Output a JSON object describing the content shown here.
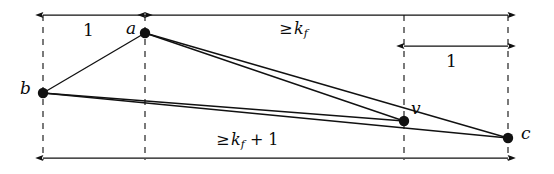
{
  "figure": {
    "type": "geometric-diagram",
    "background_color": "#ffffff",
    "ink_color": "#111111",
    "width": 554,
    "height": 174
  },
  "nodes": [
    {
      "id": "a",
      "label": "a",
      "x": 145,
      "y": 33,
      "label_x": 126,
      "label_y": 20,
      "dot_radius": 5.2
    },
    {
      "id": "b",
      "label": "b",
      "x": 43,
      "y": 93,
      "label_x": 20,
      "label_y": 80,
      "dot_radius": 5.2
    },
    {
      "id": "v",
      "label": "v",
      "x": 404,
      "y": 121,
      "label_x": 411,
      "label_y": 100,
      "dot_radius": 5.2
    },
    {
      "id": "c",
      "label": "c",
      "x": 508,
      "y": 138,
      "label_x": 521,
      "label_y": 125,
      "dot_radius": 5.2
    }
  ],
  "edges": [
    {
      "id": "b-a",
      "from": "b",
      "to": "a"
    },
    {
      "id": "a-v",
      "from": "a",
      "to": "v"
    },
    {
      "id": "a-c",
      "from": "a",
      "to": "c"
    },
    {
      "id": "b-v",
      "from": "b",
      "to": "v"
    },
    {
      "id": "b-c",
      "from": "b",
      "to": "c"
    }
  ],
  "guide_lines": [
    {
      "id": "guide-b",
      "x": 43,
      "y1": 15,
      "y2": 160
    },
    {
      "id": "guide-a",
      "x": 145,
      "y1": 15,
      "y2": 160
    },
    {
      "id": "guide-v",
      "x": 404,
      "y1": 15,
      "y2": 160
    },
    {
      "id": "guide-c",
      "x": 508,
      "y1": 15,
      "y2": 160
    }
  ],
  "measurements": [
    {
      "id": "top-left-unit",
      "label": "1",
      "label_kind": "plain",
      "x1": 43,
      "x2": 145,
      "y": 15,
      "arrow_start": true,
      "arrow_end": true,
      "label_x": 88,
      "label_y": 22
    },
    {
      "id": "top-right-kf",
      "label": "≥ k_f",
      "label_kind": "relation",
      "relation": "≥",
      "variable": "k",
      "subscript": "f",
      "x1": 145,
      "x2": 508,
      "y": 15,
      "arrow_start": true,
      "arrow_end": true,
      "label_x": 297,
      "label_y": 22
    },
    {
      "id": "right-unit",
      "label": "1",
      "label_kind": "plain",
      "x1": 404,
      "x2": 508,
      "y": 46,
      "arrow_start": true,
      "arrow_end": true,
      "label_x": 450,
      "label_y": 53
    },
    {
      "id": "bottom-kf-plus-one",
      "label": "≥ k_f + 1",
      "label_kind": "relation-sum",
      "relation": "≥",
      "variable": "k",
      "subscript": "f",
      "addend": "+ 1",
      "x1": 43,
      "x2": 508,
      "y": 158,
      "arrow_start": true,
      "arrow_end": true,
      "label_x": 240,
      "label_y": 133
    }
  ]
}
